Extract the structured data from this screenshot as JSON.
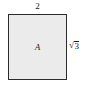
{
  "figure": {
    "type": "geometry-diagram",
    "background_color": "#ffffff",
    "shape": {
      "name": "rectangle",
      "fill_color": "#ebebeb",
      "stroke_color": "#2b2b2b",
      "interior_label": "A"
    },
    "labels": {
      "top_side": "2",
      "right_side_radical_symbol": "√",
      "right_side_radicand": "3",
      "right_side_full": "√3"
    }
  }
}
